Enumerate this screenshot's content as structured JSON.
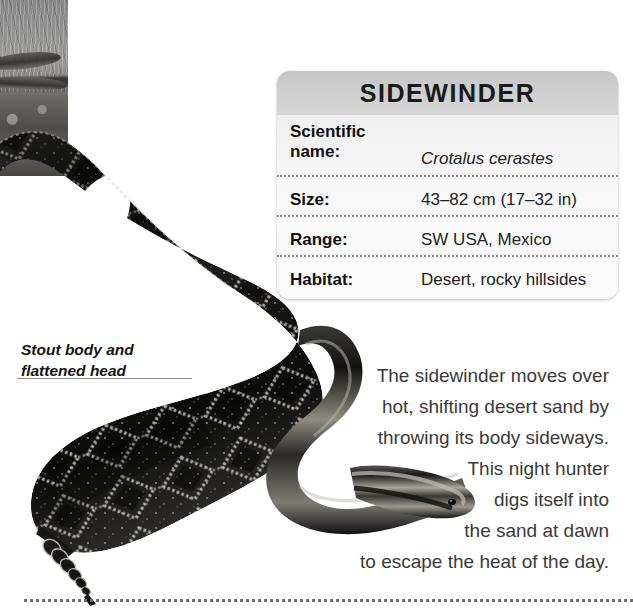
{
  "page": {
    "title": "Sidewinder",
    "background_color": "#ffffff"
  },
  "photo": {
    "name": "sidewinder-in-desert-photo",
    "description": "Grayscale photograph of a sidewinder snake crossing desert ground"
  },
  "illustration": {
    "name": "sidewinder-snake-illustration",
    "description": "Large dark diamond-patterned sidewinder rattlesnake coiled in an S-curve with rattle at tail"
  },
  "info_box": {
    "header_title": "SIDEWINDER",
    "header_gradient_from": "#c5c5c5",
    "header_gradient_to": "#d6d6d6",
    "body_color": "#f6f6f6",
    "rows": [
      {
        "label": "Scientific name:",
        "label_line1": "Scientific",
        "label_line2": "name:",
        "value": "Crotalus cerastes",
        "italic": true
      },
      {
        "label": "Size:",
        "value": "43–82 cm (17–32 in)",
        "italic": false
      },
      {
        "label": "Range:",
        "value": "SW USA, Mexico",
        "italic": false
      },
      {
        "label": "Habitat:",
        "value": "Desert, rocky hillsides",
        "italic": false
      }
    ]
  },
  "callout": {
    "line1": "Stout body and",
    "line2": "flattened head"
  },
  "body_copy": {
    "lines": [
      "The sidewinder moves over",
      "hot, shifting desert sand by",
      "throwing its body sideways.",
      "This night hunter",
      "digs itself into",
      "the sand at dawn",
      "to escape the heat of the day."
    ]
  }
}
